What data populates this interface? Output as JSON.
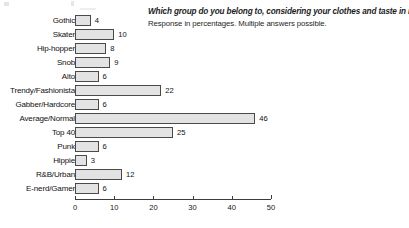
{
  "header": {
    "title": "Which group do you belong to, considering your clothes and taste in music?",
    "subtitle": "Response in percentages. Multiple answers possible."
  },
  "chart_data": {
    "type": "bar",
    "orientation": "horizontal",
    "title": "Which group do you belong to, considering your clothes and taste in music?",
    "subtitle": "Response in percentages. Multiple answers possible.",
    "xlabel": "",
    "ylabel": "",
    "xlim": [
      0,
      50
    ],
    "xticks": [
      0,
      10,
      20,
      30,
      40,
      50
    ],
    "grid": false,
    "legend": false,
    "value_labels": true,
    "bar_fill": "#e3e3e3",
    "bar_stroke": "#4a4a4a",
    "categories": [
      "Gothic",
      "Skater",
      "Hip-hopper",
      "Snob",
      "Alto",
      "Trendy/Fashionista",
      "Gabber/Hardcore",
      "Average/Normal",
      "Top 40",
      "Punk",
      "Hippie",
      "R&B/Urban",
      "E-nerd/Gamer"
    ],
    "values": [
      4,
      10,
      8,
      9,
      6,
      22,
      6,
      46,
      25,
      6,
      3,
      12,
      6
    ]
  }
}
